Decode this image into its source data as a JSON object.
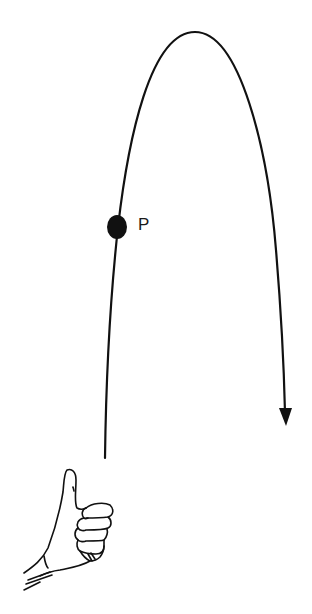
{
  "diagram": {
    "point_label": "P",
    "elements": {
      "trajectory": "parabolic-arc",
      "ball": "filled-circle-at-P",
      "arrow": "downward-arrowhead-on-descending-leg",
      "hand": "thumbs-up-hand-launch-point"
    },
    "colors": {
      "stroke": "#111111",
      "background": "#ffffff"
    }
  }
}
